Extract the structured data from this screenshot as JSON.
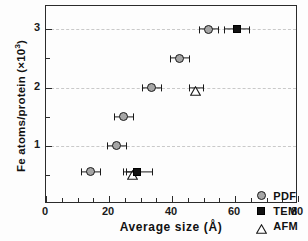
{
  "chart_data": {
    "type": "scatter",
    "title": "",
    "xlabel": "Average size (Å)",
    "ylabel": "Fe atoms/protein (×10³)",
    "xlim": [
      0,
      80
    ],
    "ylim": [
      0,
      3.4
    ],
    "xticks": [
      0,
      20,
      40,
      60,
      80
    ],
    "xtick_labels": [
      "0",
      "20",
      "40",
      "60",
      "80"
    ],
    "xminor_step": 5,
    "yticks": [
      1,
      2,
      3
    ],
    "ytick_labels": [
      "1",
      "2",
      "3"
    ],
    "yminor_ticks": [
      0.5,
      1.5,
      2.5
    ],
    "y_zero_label": "",
    "grid": "horizontal-dashed-at-major-y",
    "legend_position": "bottom-right",
    "series": [
      {
        "name": "PDF",
        "marker": "circle",
        "fill": "#a6a6a6",
        "edge": "#1a1a1a",
        "points": [
          {
            "x": 14.0,
            "y": 0.55,
            "xerr": 3.0
          },
          {
            "x": 22.5,
            "y": 1.0,
            "xerr": 3.0
          },
          {
            "x": 24.5,
            "y": 1.5,
            "xerr": 3.0
          },
          {
            "x": 33.5,
            "y": 2.0,
            "xerr": 3.0
          },
          {
            "x": 42.5,
            "y": 2.5,
            "xerr": 3.0
          },
          {
            "x": 51.5,
            "y": 3.0,
            "xerr": 3.0
          }
        ]
      },
      {
        "name": "TEM",
        "marker": "square",
        "fill": "#121212",
        "edge": "#000000",
        "points": [
          {
            "x": 29.0,
            "y": 0.55,
            "xerr": 4.5
          },
          {
            "x": 60.5,
            "y": 3.0,
            "xerr": 4.0
          }
        ]
      },
      {
        "name": "AFM",
        "marker": "triangle",
        "fill": "#ffffff",
        "edge": "#1a1a1a",
        "points": [
          {
            "x": 27.5,
            "y": 0.55,
            "xerr": 2.2
          },
          {
            "x": 47.5,
            "y": 2.0,
            "xerr": 2.2
          }
        ]
      }
    ]
  },
  "legend": {
    "entries": [
      {
        "label": "PDF",
        "marker": "circle"
      },
      {
        "label": "TEM",
        "marker": "square"
      },
      {
        "label": "AFM",
        "marker": "triangle"
      }
    ]
  },
  "axes": {
    "x_title": "Average size (Å)",
    "y_title_main": "Fe atoms/protein (×10",
    "y_title_sup": "3",
    "y_title_close": ")"
  },
  "colors": {
    "pdf_fill": "#a6a6a6",
    "tem_fill": "#121212",
    "afm_fill": "#ffffff",
    "axis": "#2b2b2b",
    "grid": "#c9c9c9"
  }
}
